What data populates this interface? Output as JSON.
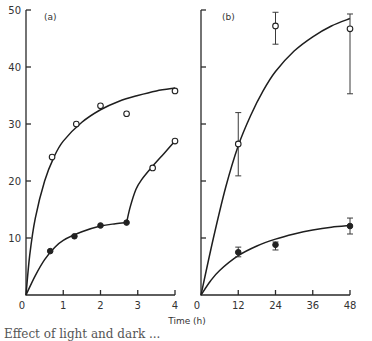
{
  "chart_data": [
    {
      "type": "line",
      "panel_label": "(a)",
      "xlabel": "Time (h)",
      "ylabel": "",
      "xlim": [
        0,
        4
      ],
      "ylim": [
        0,
        50
      ],
      "x_ticks": [
        "0",
        "1",
        "2",
        "3",
        "4"
      ],
      "y_ticks": [
        "0",
        "10",
        "20",
        "30",
        "40",
        "50"
      ],
      "grid": false,
      "series": [
        {
          "name": "open circles (upper)",
          "marker": "open-circle",
          "points": [
            [
              0.7,
              24.2
            ],
            [
              1.35,
              30.0
            ],
            [
              2.0,
              33.2
            ],
            [
              2.7,
              31.8
            ],
            [
              4.0,
              35.8
            ]
          ],
          "fit_curve": [
            [
              0,
              0
            ],
            [
              0.1,
              7
            ],
            [
              0.25,
              13.5
            ],
            [
              0.5,
              20
            ],
            [
              0.75,
              24.2
            ],
            [
              1,
              27
            ],
            [
              1.5,
              30.3
            ],
            [
              2,
              32.5
            ],
            [
              2.5,
              34
            ],
            [
              3,
              35
            ],
            [
              3.5,
              35.8
            ],
            [
              4,
              36.3
            ]
          ]
        },
        {
          "name": "filled circles",
          "marker": "filled-circle",
          "points": [
            [
              0.65,
              7.7
            ],
            [
              1.3,
              10.3
            ],
            [
              2.0,
              12.2
            ],
            [
              2.7,
              12.7
            ]
          ],
          "fit_curve": [
            [
              0,
              0
            ],
            [
              0.25,
              3.4
            ],
            [
              0.5,
              6.2
            ],
            [
              0.75,
              8.2
            ],
            [
              1,
              9.6
            ],
            [
              1.5,
              11.1
            ],
            [
              2,
              12.1
            ],
            [
              2.4,
              12.5
            ],
            [
              2.7,
              12.7
            ]
          ]
        },
        {
          "name": "open circles (after transfer)",
          "marker": "open-circle",
          "points": [
            [
              3.4,
              22.3
            ],
            [
              4.0,
              27.0
            ]
          ],
          "fit_curve": [
            [
              2.7,
              12.7
            ],
            [
              2.8,
              15.5
            ],
            [
              2.95,
              18.5
            ],
            [
              3.1,
              20.2
            ],
            [
              3.4,
              22.6
            ],
            [
              3.7,
              24.8
            ],
            [
              4,
              27
            ]
          ]
        }
      ]
    },
    {
      "type": "line",
      "panel_label": "(b)",
      "xlabel": "Time (h)",
      "ylabel": "",
      "xlim": [
        0,
        48
      ],
      "ylim": [
        0,
        50
      ],
      "x_ticks": [
        "0",
        "12",
        "24",
        "36",
        "48"
      ],
      "y_ticks": [
        "",
        "",
        "",
        "",
        "",
        ""
      ],
      "grid": false,
      "series": [
        {
          "name": "open circles",
          "marker": "open-circle",
          "points": [
            [
              12,
              26.5
            ],
            [
              24,
              47.2
            ],
            [
              48,
              46.7
            ]
          ],
          "error_bars": [
            [
              20.9,
              32.0
            ],
            [
              44.0,
              49.6
            ],
            [
              35.3,
              49.3
            ]
          ],
          "fit_curve": [
            [
              0,
              0
            ],
            [
              4,
              10
            ],
            [
              8,
              19
            ],
            [
              12,
              26.2
            ],
            [
              16,
              31.5
            ],
            [
              20,
              35.8
            ],
            [
              24,
              39.2
            ],
            [
              30,
              42.8
            ],
            [
              36,
              45.3
            ],
            [
              42,
              47.2
            ],
            [
              48,
              48.5
            ]
          ]
        },
        {
          "name": "filled circles",
          "marker": "filled-circle",
          "points": [
            [
              12,
              7.5
            ],
            [
              24,
              8.8
            ],
            [
              48,
              12.1
            ]
          ],
          "error_bars": [
            [
              6.7,
              8.4
            ],
            [
              7.9,
              9.3
            ],
            [
              10.7,
              13.5
            ]
          ],
          "fit_curve": [
            [
              0,
              0
            ],
            [
              3,
              2.4
            ],
            [
              6,
              4.3
            ],
            [
              12,
              6.9
            ],
            [
              18,
              8.6
            ],
            [
              24,
              9.8
            ],
            [
              30,
              10.7
            ],
            [
              36,
              11.4
            ],
            [
              42,
              11.9
            ],
            [
              48,
              12.2
            ]
          ]
        }
      ]
    }
  ],
  "labels": {
    "panel_a": "(a)",
    "panel_b": "(b)",
    "xlabel": "Time (h)",
    "caption": "Effect of light and dark ..."
  }
}
